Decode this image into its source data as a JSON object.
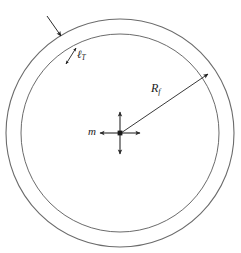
{
  "figure": {
    "type": "technical-diagram",
    "background_color": "#ffffff",
    "line_color": "#6b6b6b",
    "label_color": "#1a1a1a",
    "labels": {
      "thickness": {
        "symbol": "ℓ",
        "subscript": "T",
        "full": "ℓT"
      },
      "radius": {
        "symbol": "R",
        "subscript": "f",
        "full": "Rf"
      },
      "mass": {
        "symbol": "m",
        "subscript": "",
        "full": "m"
      }
    },
    "geometry": {
      "center_x": 120,
      "center_y": 133,
      "outer_radius": 114,
      "inner_radius": 99,
      "cross_arm_length": 18,
      "radius_arrow_angle_deg": -27
    },
    "annotations": [
      {
        "name": "shell-pointer-arrow",
        "target": "outer-circle"
      },
      {
        "name": "thickness-dimension-arrow",
        "target": "shell-wall"
      },
      {
        "name": "radius-arrow",
        "target": "inner-circle"
      },
      {
        "name": "center-cross-arrows",
        "target": "center-mass"
      }
    ]
  }
}
